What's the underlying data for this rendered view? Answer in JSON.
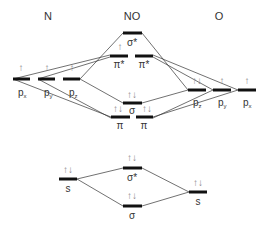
{
  "diagram": {
    "type": "molecular-orbital-diagram",
    "headers": {
      "left": "N",
      "center": "NO",
      "right": "O"
    },
    "upper": {
      "N_orbitals": [
        {
          "label": "p",
          "sub": "x",
          "electrons": "↑"
        },
        {
          "label": "p",
          "sub": "y",
          "electrons": "↑"
        },
        {
          "label": "p",
          "sub": "z",
          "electrons": "↑"
        }
      ],
      "O_orbitals": [
        {
          "label": "p",
          "sub": "z",
          "electrons": "↑↓"
        },
        {
          "label": "p",
          "sub": "y",
          "electrons": "↑"
        },
        {
          "label": "p",
          "sub": "x",
          "electrons": "↑"
        }
      ],
      "NO_orbitals": [
        {
          "label": "σ*",
          "electrons": ""
        },
        {
          "label": "π*",
          "electrons": "↑"
        },
        {
          "label": "π*",
          "electrons": ""
        },
        {
          "label": "σ",
          "electrons": "↑↓"
        },
        {
          "label": "π",
          "electrons": "↑↓"
        },
        {
          "label": "π",
          "electrons": "↑↓"
        }
      ]
    },
    "lower": {
      "N_s": {
        "label": "s",
        "electrons": "↑↓"
      },
      "O_s": {
        "label": "s",
        "electrons": "↑↓"
      },
      "NO_sigma_star": {
        "label": "σ*",
        "electrons": "↑↓"
      },
      "NO_sigma": {
        "label": "σ",
        "electrons": "↑↓"
      }
    }
  }
}
